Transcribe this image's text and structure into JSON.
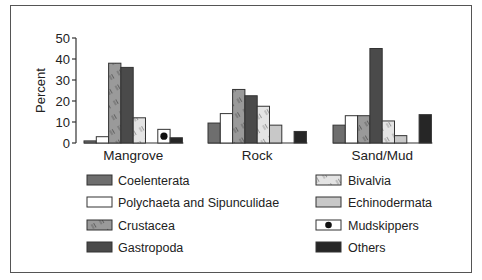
{
  "chart_data": {
    "type": "bar",
    "title": "",
    "xlabel": "",
    "ylabel": "Percent",
    "ylim": [
      0,
      50
    ],
    "yticks": [
      0,
      10,
      20,
      30,
      40,
      50
    ],
    "grid": false,
    "legend_position": "bottom",
    "categories": [
      "Mangrove",
      "Rock",
      "Sand/Mud"
    ],
    "series": [
      {
        "name": "Coelenterata",
        "values": [
          1,
          9.5,
          8.5
        ],
        "fill": "#6e6e6e",
        "pattern": "solid"
      },
      {
        "name": "Polychaeta and Sipunculidae",
        "values": [
          3,
          14,
          13
        ],
        "fill": "#ffffff",
        "pattern": "solid"
      },
      {
        "name": "Crustacea",
        "values": [
          38,
          25.5,
          13
        ],
        "fill": "#9a9a9a",
        "pattern": "hatch"
      },
      {
        "name": "Gastropoda",
        "values": [
          36,
          22.5,
          45
        ],
        "fill": "#4a4a4a",
        "pattern": "solid"
      },
      {
        "name": "Bivalvia",
        "values": [
          12,
          17.5,
          10.5
        ],
        "fill": "#e4e4e4",
        "pattern": "hatch"
      },
      {
        "name": "Echinodermata",
        "values": [
          0,
          8.5,
          3.5
        ],
        "fill": "#c8c8c8",
        "pattern": "solid"
      },
      {
        "name": "Mudskippers",
        "values": [
          6.5,
          0,
          0
        ],
        "fill": "#ffffff",
        "pattern": "dot"
      },
      {
        "name": "Others",
        "values": [
          2.5,
          5.5,
          13.5
        ],
        "fill": "#262626",
        "pattern": "solid"
      }
    ]
  },
  "legend": {
    "left": [
      "Coelenterata",
      "Polychaeta and Sipunculidae",
      "Crustacea",
      "Gastropoda"
    ],
    "right": [
      "Bivalvia",
      "Echinodermata",
      "Mudskippers",
      "Others"
    ]
  }
}
